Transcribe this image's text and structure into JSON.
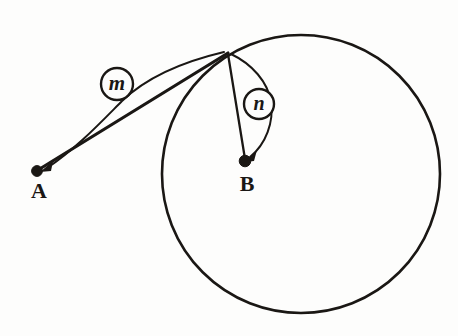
{
  "figure": {
    "background_color": "#fdfdfc",
    "ink_color": "#1a1714",
    "width": 458,
    "height": 336
  },
  "points": {
    "a": {
      "label": "A",
      "x": 37,
      "y": 171,
      "label_x": 39,
      "label_y": 198,
      "dot_radius": 5.4
    },
    "b": {
      "label": "B",
      "x": 245,
      "y": 161,
      "label_x": 247,
      "label_y": 191,
      "dot_radius": 5.8
    },
    "tangent": {
      "label": "",
      "x": 228,
      "y": 53
    }
  },
  "circle": {
    "name": "circle-B",
    "center_x": 301,
    "center_y": 174,
    "radius": 139,
    "stroke_width": 2.6
  },
  "segments": [
    {
      "name": "segment-a-to-tangent",
      "from": "A",
      "to": "tangent point",
      "stroke_width": 3.2
    },
    {
      "name": "segment-tangent-to-b",
      "from": "tangent point",
      "to": "B",
      "stroke_width": 2.3
    }
  ],
  "callouts": [
    {
      "id": "m",
      "letter": "m",
      "center_x": 117,
      "center_y": 84,
      "radius": 16,
      "font_size": 21,
      "leader_from": "tangent point",
      "leader_to": "A"
    },
    {
      "id": "n",
      "letter": "n",
      "center_x": 259,
      "center_y": 104,
      "radius": 15,
      "font_size": 20,
      "leader_from": "tangent point",
      "leader_to": "B"
    }
  ],
  "label_font_size": 22
}
